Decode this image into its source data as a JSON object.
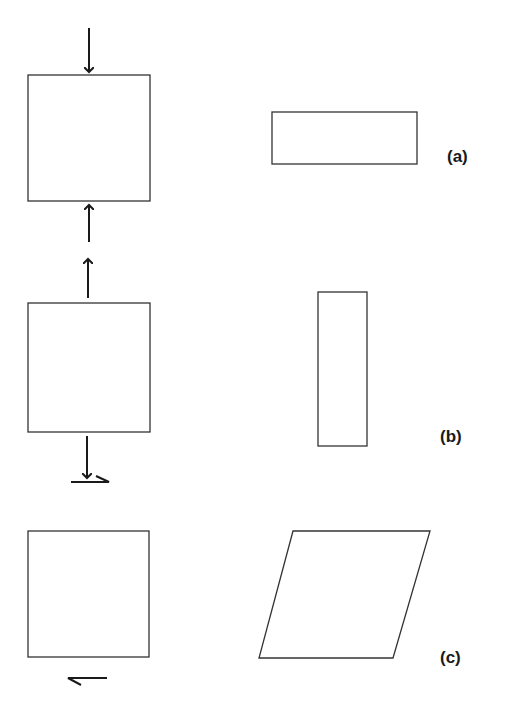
{
  "figure": {
    "panels": [
      {
        "id": "a",
        "label": "(a)",
        "load": "compression (vertical)",
        "result": "short wide rectangle"
      },
      {
        "id": "b",
        "label": "(b)",
        "load": "tension (vertical)",
        "result": "tall narrow rectangle"
      },
      {
        "id": "c",
        "label": "(c)",
        "load": "shear (horizontal, opposite)",
        "result": "parallelogram"
      }
    ],
    "colors": {
      "stroke": "#333333",
      "background": "#ffffff"
    }
  }
}
